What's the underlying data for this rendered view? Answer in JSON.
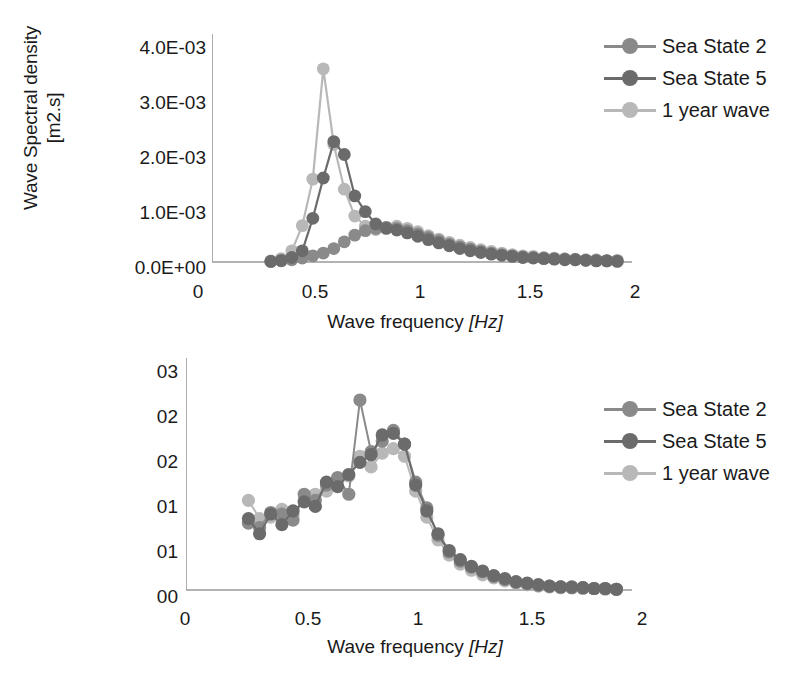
{
  "colors": {
    "sea_state_2": "#8a8a8a",
    "sea_state_5": "#6b6b6b",
    "one_year_wave": "#b8b8b8",
    "axis": "#9a9a9a",
    "text": "#1a1a1a",
    "background": "#ffffff"
  },
  "legend": {
    "items": [
      {
        "label": "Sea State 2",
        "color": "#8a8a8a"
      },
      {
        "label": "Sea State 5",
        "color": "#6b6b6b"
      },
      {
        "label": "1 year wave",
        "color": "#b8b8b8"
      }
    ]
  },
  "top": {
    "ylabel": "Wave Spectral density\n[m2.s]",
    "xlabel_text": "Wave frequency ",
    "xlabel_unit": "[Hz]",
    "yticks": [
      "0.0E+00",
      "1.0E-03",
      "2.0E-03",
      "3.0E-03",
      "4.0E-03"
    ],
    "xticks": [
      "0",
      "0.5",
      "1",
      "1.5",
      "2"
    ],
    "legend": [
      {
        "label": "Sea State 2",
        "color": "#8a8a8a"
      },
      {
        "label": "Sea State 5",
        "color": "#6b6b6b"
      },
      {
        "label": "1 year wave",
        "color": "#b8b8b8"
      }
    ]
  },
  "bottom": {
    "ylabel": "Transfer function\nheave [-]",
    "xlabel_text": "Wave frequency ",
    "xlabel_unit": "[Hz]",
    "yticks": [
      "00",
      "01",
      "01",
      "02",
      "02",
      "03"
    ],
    "xticks": [
      "0",
      "0.5",
      "1",
      "1.5",
      "2"
    ],
    "legend": [
      {
        "label": "Sea State 2",
        "color": "#8a8a8a"
      },
      {
        "label": "Sea State 5",
        "color": "#6b6b6b"
      },
      {
        "label": "1 year wave",
        "color": "#b8b8b8"
      }
    ]
  },
  "chart_data": [
    {
      "type": "line",
      "id": "wave-spectral-density",
      "title": "",
      "xlabel": "Wave frequency [Hz]",
      "ylabel": "Wave Spectral density [m2.s]",
      "xlim": [
        0,
        2
      ],
      "ylim": [
        0,
        0.004
      ],
      "xticks": [
        0,
        0.5,
        1,
        1.5,
        2
      ],
      "yticks": [
        0,
        0.001,
        0.002,
        0.003,
        0.004
      ],
      "ytick_labels": [
        "0.0E+00",
        "1.0E-03",
        "2.0E-03",
        "3.0E-03",
        "4.0E-03"
      ],
      "grid": false,
      "legend_position": "right",
      "markers": true,
      "x": [
        0.28,
        0.33,
        0.38,
        0.43,
        0.48,
        0.53,
        0.58,
        0.63,
        0.68,
        0.73,
        0.78,
        0.83,
        0.88,
        0.93,
        0.98,
        1.03,
        1.08,
        1.13,
        1.18,
        1.23,
        1.28,
        1.33,
        1.38,
        1.43,
        1.48,
        1.53,
        1.58,
        1.63,
        1.68,
        1.73,
        1.78,
        1.83,
        1.88,
        1.93
      ],
      "series": [
        {
          "name": "Sea State 2",
          "color": "#8a8a8a",
          "values": [
            1e-05,
            2e-05,
            4e-05,
            7e-05,
            0.00011,
            0.00016,
            0.00024,
            0.00036,
            0.00048,
            0.00056,
            0.0006,
            0.00062,
            0.0006,
            0.00056,
            0.0005,
            0.00044,
            0.00038,
            0.00032,
            0.00027,
            0.00023,
            0.00019,
            0.00016,
            0.00013,
            0.00011,
            9e-05,
            8e-05,
            7e-05,
            6e-05,
            5e-05,
            4e-05,
            3e-05,
            3e-05,
            2e-05,
            2e-05
          ]
        },
        {
          "name": "Sea State 5",
          "color": "#6b6b6b",
          "values": [
            1e-05,
            3e-05,
            8e-05,
            0.0002,
            0.00078,
            0.0015,
            0.00215,
            0.00192,
            0.00118,
            0.0009,
            0.00068,
            0.0006,
            0.00057,
            0.00052,
            0.00046,
            0.0004,
            0.00034,
            0.00029,
            0.00024,
            0.0002,
            0.00017,
            0.00014,
            0.00012,
            0.0001,
            8e-05,
            7e-05,
            6e-05,
            5e-05,
            4e-05,
            4e-05,
            3e-05,
            2e-05,
            2e-05,
            1e-05
          ]
        },
        {
          "name": "1 year wave",
          "color": "#b8b8b8",
          "values": [
            2e-05,
            6e-05,
            0.0002,
            0.00065,
            0.00148,
            0.00345,
            0.0021,
            0.0013,
            0.00082,
            0.00064,
            0.00058,
            0.00062,
            0.00064,
            0.0006,
            0.00054,
            0.00047,
            0.00041,
            0.00035,
            0.0003,
            0.00026,
            0.00022,
            0.00019,
            0.00016,
            0.00013,
            0.00011,
            0.0001,
            8e-05,
            7e-05,
            6e-05,
            5e-05,
            4e-05,
            4e-05,
            3e-05,
            3e-05
          ]
        }
      ]
    },
    {
      "type": "line",
      "id": "transfer-function-heave",
      "title": "",
      "xlabel": "Wave frequency [Hz]",
      "ylabel": "Transfer function heave [-]",
      "xlim": [
        0,
        2
      ],
      "ylim": [
        0,
        0.03
      ],
      "xticks": [
        0,
        0.5,
        1,
        1.5,
        2
      ],
      "yticks": [
        0,
        0.005,
        0.01,
        0.015,
        0.02,
        0.025,
        0.03
      ],
      "ytick_labels": [
        "00",
        "01",
        "01",
        "02",
        "02",
        "03"
      ],
      "grid": false,
      "legend_position": "right",
      "markers": true,
      "x": [
        0.28,
        0.33,
        0.38,
        0.43,
        0.48,
        0.53,
        0.58,
        0.63,
        0.68,
        0.73,
        0.78,
        0.83,
        0.88,
        0.93,
        0.98,
        1.03,
        1.08,
        1.13,
        1.18,
        1.23,
        1.28,
        1.33,
        1.38,
        1.43,
        1.48,
        1.53,
        1.58,
        1.63,
        1.68,
        1.73,
        1.78,
        1.83,
        1.88,
        1.93
      ],
      "series": [
        {
          "name": "Sea State 2",
          "color": "#8a8a8a",
          "values": [
            0.0088,
            0.0082,
            0.0102,
            0.01,
            0.0092,
            0.0126,
            0.0118,
            0.0138,
            0.0148,
            0.0126,
            0.025,
            0.0182,
            0.0196,
            0.021,
            0.0192,
            0.0142,
            0.0108,
            0.0072,
            0.005,
            0.0038,
            0.003,
            0.0024,
            0.0018,
            0.0014,
            0.001,
            0.0008,
            0.0006,
            0.0005,
            0.0004,
            0.0003,
            0.0003,
            0.0002,
            0.0002,
            0.0001
          ]
        },
        {
          "name": "Sea State 5",
          "color": "#6b6b6b",
          "values": [
            0.0094,
            0.0074,
            0.01,
            0.0086,
            0.0104,
            0.0116,
            0.011,
            0.0142,
            0.0136,
            0.0152,
            0.0168,
            0.0178,
            0.0204,
            0.0206,
            0.0192,
            0.0138,
            0.0104,
            0.0074,
            0.0052,
            0.004,
            0.0031,
            0.0025,
            0.0019,
            0.0015,
            0.0011,
            0.0009,
            0.0007,
            0.0005,
            0.0004,
            0.0004,
            0.0003,
            0.0002,
            0.0002,
            0.0001
          ]
        },
        {
          "name": "1 year wave",
          "color": "#b8b8b8",
          "values": [
            0.0118,
            0.0094,
            0.0096,
            0.0106,
            0.0098,
            0.0118,
            0.0126,
            0.013,
            0.0142,
            0.015,
            0.0176,
            0.0162,
            0.018,
            0.0186,
            0.0176,
            0.013,
            0.0096,
            0.0066,
            0.0046,
            0.0034,
            0.0026,
            0.002,
            0.0016,
            0.0012,
            0.0009,
            0.0007,
            0.0005,
            0.0004,
            0.0003,
            0.0003,
            0.0002,
            0.0002,
            0.0001,
            0.0001
          ]
        }
      ]
    }
  ]
}
